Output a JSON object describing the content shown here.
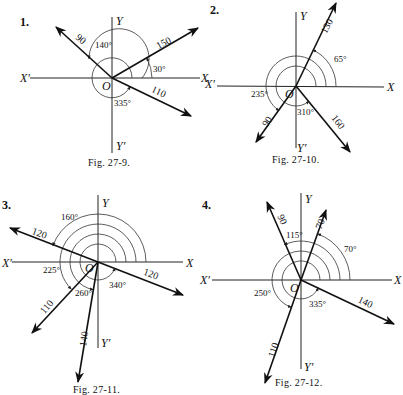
{
  "figures": [
    {
      "number": "1.",
      "caption": "Fig. 27-9.",
      "origin": [
        112,
        78
      ],
      "axes": {
        "x": "X",
        "x_neg": "X′",
        "y": "Y",
        "y_neg": "Y′",
        "origin": "O"
      },
      "vectors": [
        {
          "magnitude": "90",
          "angle_deg": 140,
          "angle_label": "140°"
        },
        {
          "magnitude": "150",
          "angle_deg": 30,
          "angle_label": "30°"
        },
        {
          "magnitude": "110",
          "angle_deg": 335,
          "angle_label": "335°"
        }
      ]
    },
    {
      "number": "2.",
      "caption": "Fig. 27-10.",
      "origin": [
        296,
        86
      ],
      "axes": {
        "x": "X",
        "x_neg": "X′",
        "y": "Y",
        "y_neg": "Y′",
        "origin": "O"
      },
      "vectors": [
        {
          "magnitude": "130",
          "angle_deg": 65,
          "angle_label": "65°"
        },
        {
          "magnitude": "90",
          "angle_deg": 235,
          "angle_label": "235°"
        },
        {
          "magnitude": "160",
          "angle_deg": 310,
          "angle_label": "310°"
        }
      ]
    },
    {
      "number": "3.",
      "caption": "Fig. 27-11.",
      "origin": [
        98,
        262
      ],
      "axes": {
        "x": "X",
        "x_neg": "X′",
        "y": "Y",
        "y_neg": "Y′",
        "origin": "O"
      },
      "vectors": [
        {
          "magnitude": "120",
          "angle_deg": 160,
          "angle_label": "160°"
        },
        {
          "magnitude": "120",
          "angle_deg": 340,
          "angle_label": "340°"
        },
        {
          "magnitude": "110",
          "angle_deg": 225,
          "angle_label": "225°"
        },
        {
          "magnitude": "140",
          "angle_deg": 260,
          "angle_label": "260°"
        }
      ]
    },
    {
      "number": "4.",
      "caption": "Fig. 27-12.",
      "origin": [
        301,
        280
      ],
      "axes": {
        "x": "X",
        "x_neg": "X′",
        "y": "Y",
        "y_neg": "Y′",
        "origin": "O"
      },
      "vectors": [
        {
          "magnitude": "90",
          "angle_deg": 115,
          "angle_label": "115°"
        },
        {
          "magnitude": "70",
          "angle_deg": 70,
          "angle_label": "70°"
        },
        {
          "magnitude": "140",
          "angle_deg": 335,
          "angle_label": "335°"
        },
        {
          "magnitude": "110",
          "angle_deg": 250,
          "angle_label": "250°"
        }
      ]
    }
  ]
}
